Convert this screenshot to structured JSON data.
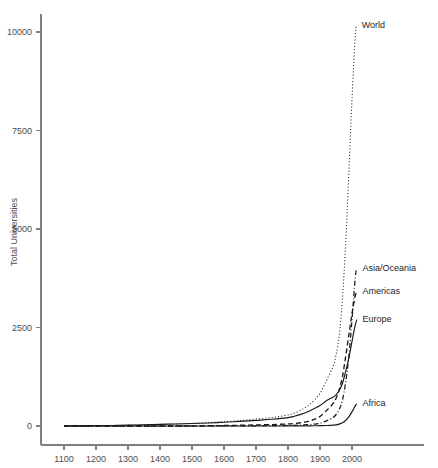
{
  "chart_data": {
    "type": "line",
    "title": "",
    "xlabel": "",
    "ylabel": "Total Universities",
    "xlim": [
      1100,
      2020
    ],
    "ylim": [
      0,
      10500
    ],
    "grid": false,
    "legend_position": "inline-right-labels",
    "xticks": [
      1100,
      1200,
      1300,
      1400,
      1500,
      1600,
      1700,
      1800,
      1900,
      2000
    ],
    "xtick_labels": [
      "1100",
      "1200",
      "1300",
      "1400",
      "1500",
      "1600",
      "1700",
      "1800",
      "1900",
      "2000"
    ],
    "yticks": [
      0,
      2500,
      5000,
      7500,
      10000
    ],
    "ytick_labels": [
      "0",
      "2500",
      "5000",
      "7500",
      "10000"
    ],
    "x": [
      1100,
      1150,
      1200,
      1250,
      1300,
      1350,
      1400,
      1450,
      1500,
      1550,
      1600,
      1650,
      1700,
      1750,
      1800,
      1820,
      1840,
      1860,
      1880,
      1900,
      1920,
      1940,
      1950,
      1960,
      1970,
      1980,
      1990,
      2000,
      2010,
      2015
    ],
    "series": [
      {
        "name": "World",
        "label": "World",
        "linestyle": "dotted",
        "color": "#1a1a1a",
        "label_x": 2018,
        "label_y": 10150,
        "values": [
          2,
          4,
          8,
          14,
          22,
          30,
          40,
          52,
          66,
          85,
          110,
          140,
          175,
          215,
          280,
          330,
          400,
          500,
          640,
          830,
          1150,
          1500,
          1800,
          2300,
          3200,
          4600,
          6400,
          8300,
          9900,
          10150
        ]
      },
      {
        "name": "Asia/Oceania",
        "label": "Asia/Oceania",
        "linestyle": "dash-dot",
        "color": "#1a1a1a",
        "label_x": 2020,
        "label_y": 4000,
        "values": [
          0,
          0,
          0,
          0,
          0,
          0,
          0,
          0,
          1,
          2,
          3,
          4,
          6,
          9,
          14,
          18,
          24,
          32,
          45,
          70,
          130,
          210,
          290,
          420,
          650,
          1100,
          1750,
          2700,
          3750,
          4000
        ]
      },
      {
        "name": "Americas",
        "label": "Americas",
        "linestyle": "dashed",
        "color": "#1a1a1a",
        "label_x": 2020,
        "label_y": 3400,
        "values": [
          0,
          0,
          0,
          0,
          0,
          0,
          0,
          0,
          1,
          6,
          12,
          18,
          26,
          36,
          52,
          64,
          82,
          110,
          160,
          240,
          390,
          560,
          700,
          920,
          1250,
          1750,
          2300,
          2850,
          3300,
          3400
        ]
      },
      {
        "name": "Europe",
        "label": "Europe",
        "linestyle": "solid",
        "color": "#1a1a1a",
        "label_x": 2020,
        "label_y": 2700,
        "values": [
          2,
          4,
          8,
          14,
          22,
          30,
          40,
          52,
          64,
          77,
          95,
          118,
          143,
          170,
          212,
          248,
          294,
          356,
          435,
          520,
          640,
          730,
          790,
          900,
          1080,
          1380,
          1720,
          2150,
          2560,
          2700
        ]
      },
      {
        "name": "Africa",
        "label": "Africa",
        "linestyle": "solid",
        "color": "#1a1a1a",
        "label_x": 2020,
        "label_y": 560,
        "values": [
          0,
          0,
          0,
          0,
          0,
          0,
          0,
          0,
          0,
          0,
          0,
          0,
          0,
          0,
          2,
          2,
          3,
          4,
          5,
          8,
          14,
          22,
          30,
          48,
          80,
          140,
          230,
          360,
          510,
          560
        ]
      }
    ]
  }
}
